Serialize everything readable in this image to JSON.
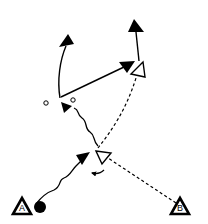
{
  "diagram": {
    "type": "sports-play-diagram",
    "colors": {
      "ink": "#000000",
      "background": "#ffffff"
    },
    "players": [
      {
        "id": "A",
        "label": "A",
        "role": "starting-player-with-ball"
      },
      {
        "id": "B",
        "label": "B",
        "role": "passer"
      }
    ],
    "legend_semantics": {
      "solid": "movement",
      "wavy": "dribble",
      "dashed": "pass"
    },
    "markers": [
      {
        "kind": "ball",
        "note": "next to player A"
      },
      {
        "kind": "cone",
        "count": 2,
        "note": "small circles near center-left"
      },
      {
        "kind": "open-triangle",
        "count": 2,
        "note": "reception positions"
      }
    ]
  }
}
